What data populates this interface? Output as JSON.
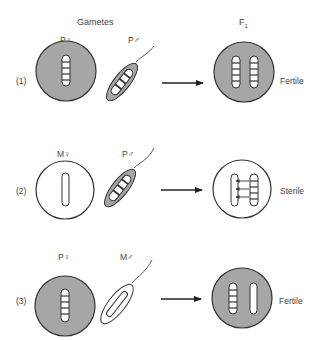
{
  "headers": {
    "gametes": "Gametes",
    "f1": "F",
    "f1_sub": "1"
  },
  "colors": {
    "fill_p": "#a6a6a6",
    "fill_m": "#ffffff",
    "stroke": "#333333",
    "band": "#ffffff"
  },
  "crosses": [
    {
      "index": "(1)",
      "female_label": "P♀",
      "male_label": "P♂",
      "female_cytotype": "P",
      "male_cytotype": "P",
      "result": "Fertile"
    },
    {
      "index": "(2)",
      "female_label": "M♀",
      "male_label": "P♂",
      "female_cytotype": "M",
      "male_cytotype": "P",
      "result": "Sterile"
    },
    {
      "index": "(3)",
      "female_label": "P♀",
      "male_label": "M♂",
      "female_cytotype": "P",
      "male_cytotype": "M",
      "result": "Fertile"
    }
  ]
}
